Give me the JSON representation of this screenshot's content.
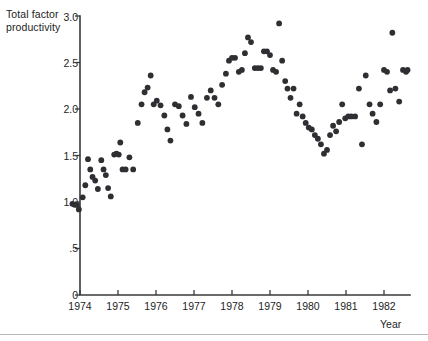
{
  "axes": {
    "y_title": "Total factor productivity",
    "x_title": "Year",
    "y_ticks": [
      "0",
      ".5",
      "1.0",
      "1.5",
      "2.0",
      "2.5",
      "3.0"
    ],
    "x_ticks": [
      "1974",
      "1975",
      "1976",
      "1977",
      "1978",
      "1979",
      "1980",
      "1981",
      "1982"
    ]
  },
  "chart_data": {
    "type": "scatter",
    "title": "",
    "xlabel": "Year",
    "ylabel": "Total factor productivity",
    "xlim": [
      1973.55,
      1982.7
    ],
    "ylim": [
      0,
      3.0
    ],
    "yticks": [
      0,
      0.5,
      1.0,
      1.5,
      2.0,
      2.5,
      3.0
    ],
    "ytick_labels": [
      "0",
      ".5",
      "1.0",
      "1.5",
      "2.0",
      "2.5",
      "3.0"
    ],
    "xticks": [
      1974,
      1975,
      1976,
      1977,
      1978,
      1979,
      1980,
      1981,
      1982
    ],
    "xtick_labels": [
      "1974",
      "1975",
      "1976",
      "1977",
      "1978",
      "1979",
      "1980",
      "1981",
      "1982"
    ],
    "grid": false,
    "legend": null,
    "marker": "filled-circle",
    "marker_color": "#2e2e33",
    "marker_size": 4.2,
    "points": [
      {
        "x": 1973.8,
        "y": 0.98
      },
      {
        "x": 1973.86,
        "y": 0.97
      },
      {
        "x": 1973.92,
        "y": 0.97
      },
      {
        "x": 1973.97,
        "y": 0.92
      },
      {
        "x": 1974.07,
        "y": 1.05
      },
      {
        "x": 1974.14,
        "y": 1.18
      },
      {
        "x": 1974.21,
        "y": 1.46
      },
      {
        "x": 1974.27,
        "y": 1.35
      },
      {
        "x": 1974.33,
        "y": 1.27
      },
      {
        "x": 1974.4,
        "y": 1.23
      },
      {
        "x": 1974.47,
        "y": 1.14
      },
      {
        "x": 1974.56,
        "y": 1.45
      },
      {
        "x": 1974.62,
        "y": 1.35
      },
      {
        "x": 1974.68,
        "y": 1.29
      },
      {
        "x": 1974.74,
        "y": 1.15
      },
      {
        "x": 1974.81,
        "y": 1.06
      },
      {
        "x": 1974.9,
        "y": 1.51
      },
      {
        "x": 1974.96,
        "y": 1.52
      },
      {
        "x": 1975.02,
        "y": 1.51
      },
      {
        "x": 1975.06,
        "y": 1.64
      },
      {
        "x": 1975.12,
        "y": 1.35
      },
      {
        "x": 1975.2,
        "y": 1.35
      },
      {
        "x": 1975.3,
        "y": 1.48
      },
      {
        "x": 1975.4,
        "y": 1.35
      },
      {
        "x": 1975.52,
        "y": 1.85
      },
      {
        "x": 1975.62,
        "y": 2.05
      },
      {
        "x": 1975.7,
        "y": 2.18
      },
      {
        "x": 1975.78,
        "y": 2.23
      },
      {
        "x": 1975.86,
        "y": 2.36
      },
      {
        "x": 1975.94,
        "y": 2.05
      },
      {
        "x": 1976.02,
        "y": 2.09
      },
      {
        "x": 1976.12,
        "y": 2.04
      },
      {
        "x": 1976.22,
        "y": 1.93
      },
      {
        "x": 1976.3,
        "y": 1.78
      },
      {
        "x": 1976.38,
        "y": 1.66
      },
      {
        "x": 1976.5,
        "y": 2.05
      },
      {
        "x": 1976.6,
        "y": 2.03
      },
      {
        "x": 1976.7,
        "y": 1.93
      },
      {
        "x": 1976.8,
        "y": 1.84
      },
      {
        "x": 1976.92,
        "y": 2.13
      },
      {
        "x": 1977.02,
        "y": 2.02
      },
      {
        "x": 1977.12,
        "y": 1.95
      },
      {
        "x": 1977.22,
        "y": 1.85
      },
      {
        "x": 1977.34,
        "y": 2.12
      },
      {
        "x": 1977.44,
        "y": 2.2
      },
      {
        "x": 1977.54,
        "y": 2.12
      },
      {
        "x": 1977.64,
        "y": 2.05
      },
      {
        "x": 1977.74,
        "y": 2.26
      },
      {
        "x": 1977.84,
        "y": 2.38
      },
      {
        "x": 1977.92,
        "y": 2.52
      },
      {
        "x": 1978.0,
        "y": 2.55
      },
      {
        "x": 1978.08,
        "y": 2.55
      },
      {
        "x": 1978.18,
        "y": 2.4
      },
      {
        "x": 1978.26,
        "y": 2.42
      },
      {
        "x": 1978.34,
        "y": 2.6
      },
      {
        "x": 1978.42,
        "y": 2.77
      },
      {
        "x": 1978.5,
        "y": 2.72
      },
      {
        "x": 1978.6,
        "y": 2.44
      },
      {
        "x": 1978.68,
        "y": 2.44
      },
      {
        "x": 1978.76,
        "y": 2.44
      },
      {
        "x": 1978.84,
        "y": 2.62
      },
      {
        "x": 1978.92,
        "y": 2.62
      },
      {
        "x": 1979.0,
        "y": 2.58
      },
      {
        "x": 1979.08,
        "y": 2.42
      },
      {
        "x": 1979.16,
        "y": 2.4
      },
      {
        "x": 1979.24,
        "y": 2.92
      },
      {
        "x": 1979.32,
        "y": 2.52
      },
      {
        "x": 1979.4,
        "y": 2.3
      },
      {
        "x": 1979.46,
        "y": 2.22
      },
      {
        "x": 1979.54,
        "y": 2.12
      },
      {
        "x": 1979.62,
        "y": 2.22
      },
      {
        "x": 1979.7,
        "y": 1.95
      },
      {
        "x": 1979.78,
        "y": 2.05
      },
      {
        "x": 1979.86,
        "y": 1.92
      },
      {
        "x": 1979.94,
        "y": 1.85
      },
      {
        "x": 1980.02,
        "y": 1.8
      },
      {
        "x": 1980.1,
        "y": 1.78
      },
      {
        "x": 1980.18,
        "y": 1.72
      },
      {
        "x": 1980.26,
        "y": 1.68
      },
      {
        "x": 1980.34,
        "y": 1.62
      },
      {
        "x": 1980.42,
        "y": 1.52
      },
      {
        "x": 1980.5,
        "y": 1.56
      },
      {
        "x": 1980.58,
        "y": 1.72
      },
      {
        "x": 1980.66,
        "y": 1.82
      },
      {
        "x": 1980.74,
        "y": 1.76
      },
      {
        "x": 1980.82,
        "y": 1.86
      },
      {
        "x": 1980.9,
        "y": 2.05
      },
      {
        "x": 1980.98,
        "y": 1.9
      },
      {
        "x": 1981.06,
        "y": 1.92
      },
      {
        "x": 1981.14,
        "y": 1.92
      },
      {
        "x": 1981.24,
        "y": 1.92
      },
      {
        "x": 1981.34,
        "y": 2.22
      },
      {
        "x": 1981.42,
        "y": 1.62
      },
      {
        "x": 1981.52,
        "y": 2.36
      },
      {
        "x": 1981.62,
        "y": 2.05
      },
      {
        "x": 1981.7,
        "y": 1.95
      },
      {
        "x": 1981.8,
        "y": 1.86
      },
      {
        "x": 1981.9,
        "y": 2.05
      },
      {
        "x": 1982.0,
        "y": 2.42
      },
      {
        "x": 1982.08,
        "y": 2.4
      },
      {
        "x": 1982.16,
        "y": 2.2
      },
      {
        "x": 1982.22,
        "y": 2.82
      },
      {
        "x": 1982.3,
        "y": 2.22
      },
      {
        "x": 1982.4,
        "y": 2.08
      },
      {
        "x": 1982.5,
        "y": 2.42
      },
      {
        "x": 1982.58,
        "y": 2.4
      },
      {
        "x": 1982.62,
        "y": 2.42
      }
    ]
  }
}
